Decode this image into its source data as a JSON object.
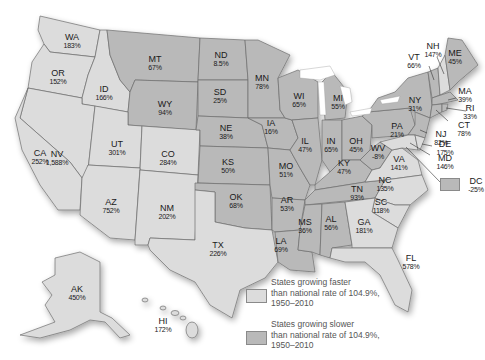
{
  "colors": {
    "faster": "#dcdcdc",
    "slower": "#b9b9b9",
    "border": "#6e6e6e",
    "water": "#ffffff",
    "text": "#1a1a1a",
    "legend_text": "#555555"
  },
  "legend": {
    "items": [
      {
        "key": "faster",
        "line1": "States growing faster",
        "line2": "than national rate of 104.9%,",
        "line3": "1950–2010"
      },
      {
        "key": "slower",
        "line1": "States growing slower",
        "line2": "than national rate of 104.9%,",
        "line3": "1950–2010"
      }
    ]
  },
  "states": [
    {
      "abbr": "WA",
      "pct": "183%",
      "cat": "faster"
    },
    {
      "abbr": "OR",
      "pct": "152%",
      "cat": "faster"
    },
    {
      "abbr": "ID",
      "pct": "166%",
      "cat": "faster"
    },
    {
      "abbr": "MT",
      "pct": "67%",
      "cat": "slower"
    },
    {
      "abbr": "WY",
      "pct": "94%",
      "cat": "slower"
    },
    {
      "abbr": "ND",
      "pct": "8.5%",
      "cat": "slower"
    },
    {
      "abbr": "SD",
      "pct": "25%",
      "cat": "slower"
    },
    {
      "abbr": "NE",
      "pct": "38%",
      "cat": "slower"
    },
    {
      "abbr": "MN",
      "pct": "78%",
      "cat": "slower"
    },
    {
      "abbr": "WI",
      "pct": "65%",
      "cat": "slower"
    },
    {
      "abbr": "IA",
      "pct": "16%",
      "cat": "slower"
    },
    {
      "abbr": "MI",
      "pct": "55%",
      "cat": "slower"
    },
    {
      "abbr": "NV",
      "pct": "1,588%",
      "cat": "faster"
    },
    {
      "abbr": "UT",
      "pct": "301%",
      "cat": "faster"
    },
    {
      "abbr": "CO",
      "pct": "284%",
      "cat": "faster"
    },
    {
      "abbr": "CA",
      "pct": "252%",
      "cat": "faster"
    },
    {
      "abbr": "AZ",
      "pct": "752%",
      "cat": "faster"
    },
    {
      "abbr": "NM",
      "pct": "202%",
      "cat": "faster"
    },
    {
      "abbr": "KS",
      "pct": "50%",
      "cat": "slower"
    },
    {
      "abbr": "OK",
      "pct": "68%",
      "cat": "slower"
    },
    {
      "abbr": "TX",
      "pct": "226%",
      "cat": "faster"
    },
    {
      "abbr": "MO",
      "pct": "51%",
      "cat": "slower"
    },
    {
      "abbr": "AR",
      "pct": "53%",
      "cat": "slower"
    },
    {
      "abbr": "LA",
      "pct": "69%",
      "cat": "slower"
    },
    {
      "abbr": "IL",
      "pct": "47%",
      "cat": "slower"
    },
    {
      "abbr": "IN",
      "pct": "65%",
      "cat": "slower"
    },
    {
      "abbr": "OH",
      "pct": "45%",
      "cat": "slower"
    },
    {
      "abbr": "KY",
      "pct": "47%",
      "cat": "slower"
    },
    {
      "abbr": "TN",
      "pct": "93%",
      "cat": "slower"
    },
    {
      "abbr": "MS",
      "pct": "36%",
      "cat": "slower"
    },
    {
      "abbr": "AL",
      "pct": "56%",
      "cat": "slower"
    },
    {
      "abbr": "GA",
      "pct": "181%",
      "cat": "faster"
    },
    {
      "abbr": "FL",
      "pct": "578%",
      "cat": "faster"
    },
    {
      "abbr": "SC",
      "pct": "118%",
      "cat": "faster"
    },
    {
      "abbr": "NC",
      "pct": "135%",
      "cat": "faster"
    },
    {
      "abbr": "VA",
      "pct": "141%",
      "cat": "faster"
    },
    {
      "abbr": "WV",
      "pct": "-8%",
      "cat": "slower"
    },
    {
      "abbr": "PA",
      "pct": "21%",
      "cat": "slower"
    },
    {
      "abbr": "NY",
      "pct": "31%",
      "cat": "slower"
    },
    {
      "abbr": "VT",
      "pct": "66%",
      "cat": "slower"
    },
    {
      "abbr": "NH",
      "pct": "147%",
      "cat": "faster"
    },
    {
      "abbr": "ME",
      "pct": "45%",
      "cat": "slower"
    },
    {
      "abbr": "MA",
      "pct": "39%",
      "cat": "slower"
    },
    {
      "abbr": "RI",
      "pct": "33%",
      "cat": "slower"
    },
    {
      "abbr": "CT",
      "pct": "78%",
      "cat": "slower"
    },
    {
      "abbr": "NJ",
      "pct": "82%",
      "cat": "slower"
    },
    {
      "abbr": "DE",
      "pct": "175%",
      "cat": "faster"
    },
    {
      "abbr": "MD",
      "pct": "146%",
      "cat": "faster"
    },
    {
      "abbr": "DC",
      "pct": "-25%",
      "cat": "slower"
    },
    {
      "abbr": "AK",
      "pct": "450%",
      "cat": "faster"
    },
    {
      "abbr": "HI",
      "pct": "172%",
      "cat": "faster"
    }
  ],
  "national_rate": "104.9%",
  "period": "1950–2010"
}
